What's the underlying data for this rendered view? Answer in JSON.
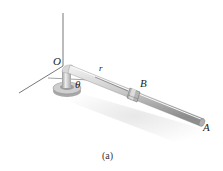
{
  "figure": {
    "caption": "(a)",
    "labels": {
      "origin": "O",
      "radius": "r",
      "angle": "θ",
      "collar": "B",
      "end": "A"
    },
    "colors": {
      "rod_light": "#e6e6e6",
      "rod_mid": "#bdbdbd",
      "rod_dark": "#8a8a8a",
      "axis": "#555555",
      "shadow": "#ececec"
    }
  }
}
